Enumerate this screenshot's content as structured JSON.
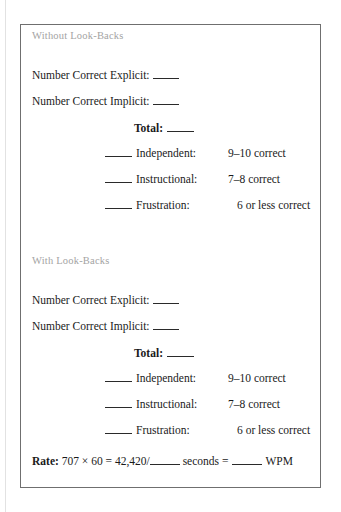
{
  "document": {
    "sections": [
      {
        "header": "Without Look-Backs",
        "count_explicit_label": "Number Correct Explicit:",
        "count_implicit_label": "Number Correct Implicit:",
        "total_label": "Total:",
        "criteria": [
          {
            "label": "Independent:",
            "value": "9–10 correct"
          },
          {
            "label": "Instructional:",
            "value": "7–8 correct"
          },
          {
            "label": "Frustration:",
            "value": "6 or less correct"
          }
        ]
      },
      {
        "header": "With Look-Backs",
        "count_explicit_label": "Number Correct Explicit:",
        "count_implicit_label": "Number Correct Implicit:",
        "total_label": "Total:",
        "criteria": [
          {
            "label": "Independent:",
            "value": "9–10 correct"
          },
          {
            "label": "Instructional:",
            "value": "7–8 correct"
          },
          {
            "label": "Frustration:",
            "value": "6 or less correct"
          }
        ]
      }
    ],
    "rate": {
      "label": "Rate:",
      "formula": "707 × 60 = 42,420/",
      "seconds_unit": "seconds =",
      "wpm_unit": "WPM"
    }
  }
}
